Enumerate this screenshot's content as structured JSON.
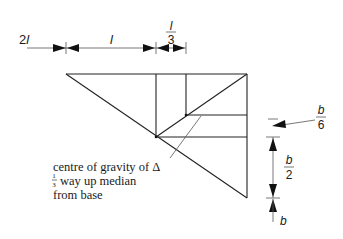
{
  "diagram": {
    "type": "geometric construction — centroid of a triangle",
    "top_dimensions": [
      {
        "id": "dim-2l",
        "label_num": "2",
        "label_var": "l"
      },
      {
        "id": "dim-l",
        "label_var": "l"
      },
      {
        "id": "dim-l3",
        "label_num": "l",
        "label_den": "3"
      }
    ],
    "right_dimensions": [
      {
        "id": "dim-b6",
        "label_num": "b",
        "label_den": "6"
      },
      {
        "id": "dim-b2",
        "label_num": "b",
        "label_den": "2"
      },
      {
        "id": "dim-b",
        "label_var": "b"
      }
    ],
    "annotation": {
      "line1": "centre of gravity of Δ",
      "fraction_num": "1",
      "fraction_den": "3",
      "line2_rest": "way up median",
      "line3": "from base"
    },
    "colors": {
      "stroke": "#222222",
      "background": "#ffffff"
    }
  }
}
